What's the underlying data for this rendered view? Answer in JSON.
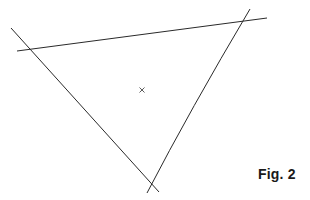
{
  "figure": {
    "caption": "Fig. 2",
    "line_color": "#2a2a2a",
    "lines": [
      {
        "name": "top-line",
        "x1": 17,
        "y1": 51,
        "x2": 267,
        "y2": 18
      },
      {
        "name": "left-line",
        "x1": 11,
        "y1": 28,
        "x2": 159,
        "y2": 192
      },
      {
        "name": "right-line",
        "x1": 250,
        "y1": 9,
        "x2": 147,
        "y2": 193
      }
    ],
    "center_mark": {
      "symbol": "×",
      "x": 142,
      "y": 90
    }
  }
}
